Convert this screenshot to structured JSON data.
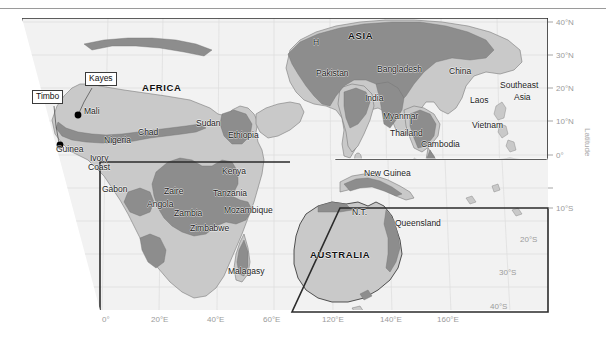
{
  "figure": {
    "type": "map",
    "axes": {
      "x_title": "",
      "y_title": "Latitude",
      "longitude_ticks": [
        "0°",
        "20°E",
        "40°E",
        "60°E",
        "120°E",
        "140°E",
        "160°E"
      ],
      "latitude_ticks": [
        "40°N",
        "30°N",
        "20°N",
        "10°N",
        "0°",
        "10°S",
        "20°S",
        "30°S",
        "40°S"
      ]
    },
    "colors": {
      "ocean": "#f2f2f2",
      "land": "#c9c9c9",
      "range_shade": "#8d8d8d",
      "border": "#2b2b2b",
      "graticule": "#d8d8d8",
      "axis_text": "#9b9b9b",
      "callout_fill": "#ffffff",
      "point": "#000000"
    },
    "continents": [
      {
        "label": "AFRICA",
        "x": 148,
        "y": 78
      },
      {
        "label": "ASIA",
        "x": 355,
        "y": 26
      },
      {
        "label": "AUSTRALIA",
        "x": 336,
        "y": 245
      }
    ],
    "places": [
      {
        "label": "H",
        "x": 315,
        "y": 33
      },
      {
        "label": "Pakistan",
        "x": 316,
        "y": 56
      },
      {
        "label": "Bangladesh",
        "x": 381,
        "y": 55
      },
      {
        "label": "China",
        "x": 451,
        "y": 57
      },
      {
        "label": "India",
        "x": 367,
        "y": 85
      },
      {
        "label": "Myanmar",
        "x": 389,
        "y": 102
      },
      {
        "label": "Laos",
        "x": 470,
        "y": 87
      },
      {
        "label": "Vietnam",
        "x": 470,
        "y": 112
      },
      {
        "label": "I",
        "x": 410,
        "y": 111
      },
      {
        "label": "Thailand",
        "x": 393,
        "y": 122
      },
      {
        "label": "Cambodia",
        "x": 424,
        "y": 132
      },
      {
        "label": "Mali",
        "x": 87,
        "y": 98
      },
      {
        "label": "Guinea",
        "x": 68,
        "y": 135
      },
      {
        "label": "Nigeria",
        "x": 111,
        "y": 128
      },
      {
        "label": "Ivory",
        "x": 95,
        "y": 145
      },
      {
        "label": "Coast",
        "x": 95,
        "y": 155
      },
      {
        "label": "Chad",
        "x": 140,
        "y": 120
      },
      {
        "label": "Sudan",
        "x": 200,
        "y": 111
      },
      {
        "label": "Ethiopia",
        "x": 235,
        "y": 122
      },
      {
        "label": "Kenya",
        "x": 228,
        "y": 159
      },
      {
        "label": "Gabon",
        "x": 109,
        "y": 176
      },
      {
        "label": "Zaire",
        "x": 168,
        "y": 179
      },
      {
        "label": "Tanzania",
        "x": 224,
        "y": 181
      },
      {
        "label": "Angola",
        "x": 153,
        "y": 192
      },
      {
        "label": "Zambia",
        "x": 181,
        "y": 200
      },
      {
        "label": "Mozambique",
        "x": 232,
        "y": 198
      },
      {
        "label": "Zimbabwe",
        "x": 199,
        "y": 216
      },
      {
        "label": "Malagasy",
        "x": 234,
        "y": 259
      },
      {
        "label": "New Guinea",
        "x": 371,
        "y": 161
      },
      {
        "label": "N.T.",
        "x": 357,
        "y": 200
      },
      {
        "label": "Queensland",
        "x": 400,
        "y": 212
      },
      {
        "label": "Southeast",
        "x": 506,
        "y": 76
      },
      {
        "label": "Asia",
        "x": 518,
        "y": 88
      }
    ],
    "callouts": [
      {
        "label": "Kayes",
        "x": 86,
        "y": 66,
        "point_x": 78,
        "point_y": 105
      },
      {
        "label": "Timbo",
        "x": 36,
        "y": 84,
        "point_x": 60,
        "point_y": 135
      }
    ],
    "points": [
      {
        "x": 78,
        "y": 105
      },
      {
        "x": 60,
        "y": 135
      }
    ],
    "longitude_tick_positions": [
      {
        "label": "0°",
        "x": 108
      },
      {
        "label": "20°E",
        "x": 163
      },
      {
        "label": "40°E",
        "x": 219
      },
      {
        "label": "60°E",
        "x": 274
      },
      {
        "label": "120°E",
        "x": 385
      },
      {
        "label": "140°E",
        "x": 441
      },
      {
        "label": "160°E",
        "x": 497
      }
    ],
    "latitude_tick_positions": [
      {
        "label": "40°N",
        "y": 12
      },
      {
        "label": "30°N",
        "y": 45
      },
      {
        "label": "20°N",
        "y": 78
      },
      {
        "label": "10°N",
        "y": 111
      },
      {
        "label": "0°",
        "y": 145
      },
      {
        "label": "10°S",
        "y": 198
      },
      {
        "label": "20°S",
        "y": 229
      },
      {
        "label": "30°S",
        "y": 262
      },
      {
        "label": "40°S",
        "y": 294
      }
    ]
  }
}
